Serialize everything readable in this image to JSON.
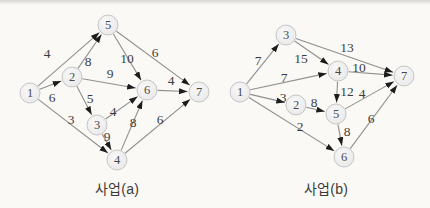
{
  "page": {
    "background": "#faf9f5"
  },
  "style": {
    "node_radius": 10,
    "node_fill_center": "#f8f8f8",
    "node_fill_edge": "#e7e7e7",
    "node_border": "#c6c6c6",
    "node_text": "#4a4a4a",
    "edge_line": "#8f8f8f",
    "arrow": "#1c1c1c",
    "weight_text": "#3d3d3d",
    "caption_text": "#3a3a3a"
  },
  "graphs": [
    {
      "id": "a",
      "caption": "사업(a)",
      "caption_x": 117,
      "caption_y": 187,
      "nodes": [
        {
          "id": "1",
          "x": 30,
          "y": 93
        },
        {
          "id": "2",
          "x": 72,
          "y": 77
        },
        {
          "id": "3",
          "x": 97,
          "y": 125
        },
        {
          "id": "4",
          "x": 117,
          "y": 160
        },
        {
          "id": "5",
          "x": 108,
          "y": 25
        },
        {
          "id": "6",
          "x": 147,
          "y": 90
        },
        {
          "id": "7",
          "x": 199,
          "y": 92
        }
      ],
      "edges": [
        {
          "from": "1",
          "to": "5",
          "weight": "4",
          "lx": 47,
          "ly": 53
        },
        {
          "from": "1",
          "to": "2",
          "weight": "6",
          "lx": 52,
          "ly": 97
        },
        {
          "from": "1",
          "to": "4",
          "weight": "3",
          "lx": 71,
          "ly": 119
        },
        {
          "from": "2",
          "to": "5",
          "weight": "8",
          "lx": 88,
          "ly": 61
        },
        {
          "from": "2",
          "to": "6",
          "weight": "9",
          "lx": 110,
          "ly": 73
        },
        {
          "from": "2",
          "to": "3",
          "weight": "5",
          "lx": 90,
          "ly": 98
        },
        {
          "from": "5",
          "to": "6",
          "weight": "10",
          "lx": 127,
          "ly": 58
        },
        {
          "from": "5",
          "to": "7",
          "weight": "6",
          "lx": 155,
          "ly": 52
        },
        {
          "from": "3",
          "to": "6",
          "weight": "4",
          "lx": 113,
          "ly": 111
        },
        {
          "from": "3",
          "to": "4",
          "weight": "9",
          "lx": 107,
          "ly": 136
        },
        {
          "from": "4",
          "to": "6",
          "weight": "8",
          "lx": 133,
          "ly": 122
        },
        {
          "from": "4",
          "to": "7",
          "weight": "6",
          "lx": 160,
          "ly": 119
        },
        {
          "from": "6",
          "to": "7",
          "weight": "4",
          "lx": 171,
          "ly": 80
        }
      ]
    },
    {
      "id": "b",
      "caption": "사업(b)",
      "caption_x": 326,
      "caption_y": 187,
      "nodes": [
        {
          "id": "1",
          "x": 240,
          "y": 92
        },
        {
          "id": "2",
          "x": 296,
          "y": 105
        },
        {
          "id": "3",
          "x": 286,
          "y": 35
        },
        {
          "id": "4",
          "x": 338,
          "y": 71
        },
        {
          "id": "5",
          "x": 336,
          "y": 114
        },
        {
          "id": "6",
          "x": 344,
          "y": 157
        },
        {
          "id": "7",
          "x": 404,
          "y": 76
        }
      ],
      "edges": [
        {
          "from": "1",
          "to": "3",
          "weight": "7",
          "lx": 258,
          "ly": 60
        },
        {
          "from": "1",
          "to": "4",
          "weight": "7",
          "lx": 284,
          "ly": 77
        },
        {
          "from": "1",
          "to": "2",
          "weight": "3",
          "lx": 283,
          "ly": 97
        },
        {
          "from": "1",
          "to": "6",
          "weight": "2",
          "lx": 300,
          "ly": 126
        },
        {
          "from": "3",
          "to": "4",
          "weight": "15",
          "lx": 301,
          "ly": 58
        },
        {
          "from": "3",
          "to": "7",
          "weight": "13",
          "lx": 347,
          "ly": 47
        },
        {
          "from": "4",
          "to": "7",
          "weight": "10",
          "lx": 359,
          "ly": 67
        },
        {
          "from": "4",
          "to": "5",
          "weight": "12",
          "lx": 347,
          "ly": 91
        },
        {
          "from": "2",
          "to": "5",
          "weight": "8",
          "lx": 314,
          "ly": 102
        },
        {
          "from": "5",
          "to": "7",
          "weight": "4",
          "lx": 362,
          "ly": 93
        },
        {
          "from": "5",
          "to": "6",
          "weight": "8",
          "lx": 347,
          "ly": 131
        },
        {
          "from": "6",
          "to": "7",
          "weight": "6",
          "lx": 371,
          "ly": 118
        }
      ]
    }
  ]
}
